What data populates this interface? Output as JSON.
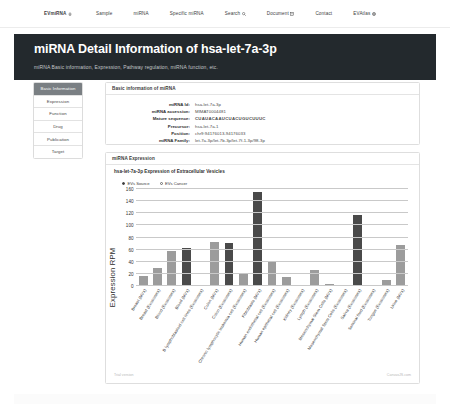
{
  "nav": {
    "items": [
      {
        "label": "EVmiRNA",
        "icon": "home-icon",
        "brand": true
      },
      {
        "label": "Sample",
        "icon": "",
        "brand": false
      },
      {
        "label": "miRNA",
        "icon": "",
        "brand": false
      },
      {
        "label": "Specific miRNA",
        "icon": "",
        "brand": false
      },
      {
        "label": "Search",
        "icon": "search-icon",
        "brand": false
      },
      {
        "label": "Document",
        "icon": "document-icon",
        "brand": false
      },
      {
        "label": "Contact",
        "icon": "",
        "brand": false
      },
      {
        "label": "EVAtlas",
        "icon": "globe-icon",
        "brand": false
      }
    ]
  },
  "hero": {
    "title": "miRNA Detail Information of hsa-let-7a-3p",
    "subtitle": "miRNA Basic information, Expression, Pathway regulation, miRNA function, etc."
  },
  "sidebar": {
    "items": [
      {
        "label": "Basic Information",
        "active": true
      },
      {
        "label": "Expression",
        "active": false
      },
      {
        "label": "Function",
        "active": false
      },
      {
        "label": "Drug",
        "active": false
      },
      {
        "label": "Publication",
        "active": false
      },
      {
        "label": "Target",
        "active": false
      }
    ]
  },
  "basic_panel": {
    "header": "Basic information of miRNA",
    "rows": [
      {
        "key": "miRNA Id:",
        "value": "hsa-let-7a-3p",
        "mono": false
      },
      {
        "key": "miRNA accession:",
        "value": "MIMAT0004481",
        "mono": false
      },
      {
        "key": "Mature sequence:",
        "value": "CUAUACAAUCUACUGUCUUUC",
        "mono": true
      },
      {
        "key": "Precursor:",
        "value": "hsa-let-7a-1",
        "mono": false
      },
      {
        "key": "Position:",
        "value": "chr9:94176013-94176033",
        "mono": false
      },
      {
        "key": "miRNA Family:",
        "value": "let-7a-3p/let-7b-3p/let-7f-1-3p/98-3p",
        "mono": false
      }
    ]
  },
  "expression_panel": {
    "header": "miRNA Expression",
    "chart_title": "hsa-let-7a-3p Expression of Extracellular Vesicles",
    "radios": [
      {
        "label": "EVs Source",
        "selected": true
      },
      {
        "label": "EVs Cancer",
        "selected": false
      }
    ],
    "footer_left": "Trial version",
    "footer_right": "CanvasJS.com"
  },
  "chart_data": {
    "type": "bar",
    "title": "hsa-let-7a-3p Expression of Extracellular Vesicles",
    "xlabel": "",
    "ylabel": "Expression RPM",
    "ylim": [
      0,
      160
    ],
    "yticks": [
      0,
      20,
      40,
      60,
      80,
      100,
      120,
      140,
      160
    ],
    "grid": true,
    "legend": false,
    "categories": [
      "Breast (MVs)",
      "Breast (Exosomes)",
      "Blood (Exosomes)",
      "Blood (MVs)",
      "B lymphoblastoid cell lines (Exosomes)",
      "Colon (MVs)",
      "Colon (Exosomes)",
      "Chronic lymphocytic leukemia cell (Exosomes)",
      "Fibroblasts (MVs)",
      "Human endothelial cell (Exosomes)",
      "Human epithelial cell (Exosomes)",
      "Kidney (Exosomes)",
      "Lymph (Exosomes)",
      "Mesenchymal Stem Cells (MVs)",
      "Mesenchymal Stem Cells (Exosomes)",
      "Saliva (Exosomes)",
      "Seminal fluid (Exosomes)",
      "Tongue (Exosomes)",
      "Urine (MVs)"
    ],
    "values": [
      17,
      30,
      57,
      63,
      2,
      72,
      71,
      22,
      155,
      42,
      15,
      1,
      27,
      3,
      1,
      117,
      1,
      10,
      68
    ],
    "colors": [
      "#9c9c9c",
      "#9c9c9c",
      "#9c9c9c",
      "#4a4a4a",
      "#9c9c9c",
      "#9c9c9c",
      "#4a4a4a",
      "#9c9c9c",
      "#4a4a4a",
      "#9c9c9c",
      "#9c9c9c",
      "#9c9c9c",
      "#9c9c9c",
      "#9c9c9c",
      "#9c9c9c",
      "#4a4a4a",
      "#9c9c9c",
      "#9c9c9c",
      "#9c9c9c"
    ]
  },
  "theme": {
    "hero_bg": "#23292d",
    "sidebar_active_bg": "#7a7f83",
    "bar_light": "#9c9c9c",
    "bar_dark": "#4a4a4a"
  }
}
